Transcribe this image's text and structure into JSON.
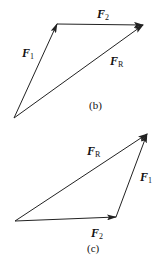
{
  "diagram_b": {
    "caption": "(b)",
    "vectors": [
      {
        "name": "F",
        "sub": "1",
        "from": [
          14,
          118
        ],
        "to": [
          57,
          24
        ]
      },
      {
        "name": "F",
        "sub": "2",
        "from": [
          57,
          24
        ],
        "to": [
          143,
          25
        ]
      },
      {
        "name": "F",
        "sub": "R",
        "from": [
          14,
          118
        ],
        "to": [
          143,
          25
        ]
      }
    ]
  },
  "diagram_c": {
    "caption": "(c)",
    "vectors": [
      {
        "name": "F",
        "sub": "2",
        "from": [
          15,
          221
        ],
        "to": [
          116,
          217
        ]
      },
      {
        "name": "F",
        "sub": "1",
        "from": [
          116,
          217
        ],
        "to": [
          147,
          134
        ]
      },
      {
        "name": "F",
        "sub": "R",
        "from": [
          15,
          221
        ],
        "to": [
          147,
          134
        ]
      }
    ]
  },
  "colors": {
    "line": "#222222",
    "background": "#ffffff"
  }
}
